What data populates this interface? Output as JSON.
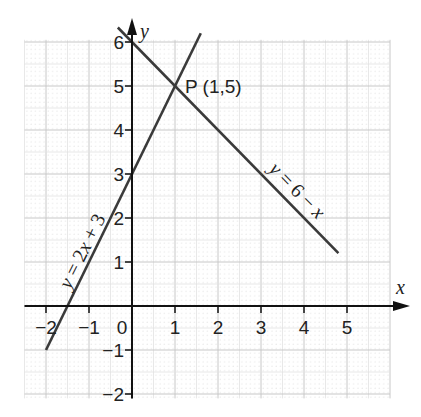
{
  "chart_data": {
    "type": "line",
    "title": "",
    "xlabel": "x",
    "ylabel": "y",
    "xlim": [
      -2.5,
      6.0
    ],
    "ylim": [
      -2.1,
      6.05
    ],
    "grid": true,
    "x_ticks": [
      -2,
      -1,
      0,
      1,
      2,
      3,
      4,
      5
    ],
    "y_ticks": [
      -2,
      -1,
      1,
      2,
      3,
      4,
      5,
      6
    ],
    "x_tick_labels": [
      "−2",
      "−1",
      "0",
      "1",
      "2",
      "3",
      "4",
      "5"
    ],
    "y_tick_labels": [
      "−2",
      "−1",
      "1",
      "2",
      "3",
      "4",
      "5",
      "6"
    ],
    "origin_label": "0",
    "series": [
      {
        "name": "y = 2x + 3",
        "label_parts": [
          "y",
          " = 2",
          "x",
          " + 3"
        ],
        "x": [
          -2,
          1.6
        ],
        "y": [
          -1,
          6.2
        ]
      },
      {
        "name": "y = 6 − x",
        "label_parts": [
          "y",
          " = 6 − ",
          "x"
        ],
        "x": [
          -0.33,
          4.8
        ],
        "y": [
          6.33,
          1.2
        ]
      }
    ],
    "annotations": [
      {
        "text": "P (1,5)",
        "x": 1,
        "y": 5
      }
    ],
    "colors": {
      "line": "#3a3a3a",
      "axis": "#111111",
      "grid_major": "#c8c8c8",
      "grid_minor": "#e2e2e2",
      "text": "#222222"
    }
  }
}
